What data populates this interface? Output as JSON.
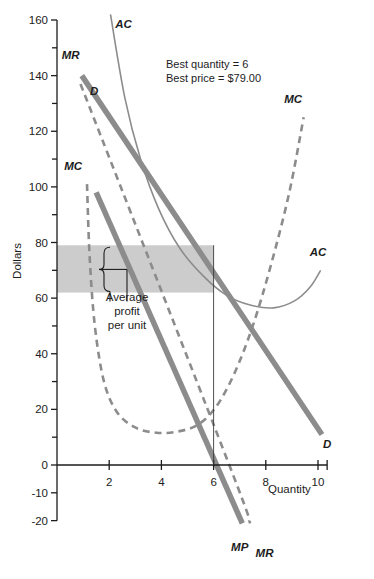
{
  "chart_data": {
    "type": "line",
    "title": "",
    "xlabel": "Quantity",
    "ylabel": "Dollars",
    "xlim": [
      0,
      10.6
    ],
    "ylim": [
      -20,
      160
    ],
    "x_ticks": [
      2,
      4,
      6,
      8,
      10
    ],
    "x_tick_labels": [
      "2",
      "4",
      "6",
      "8",
      "10"
    ],
    "y_ticks": [
      -20,
      -10,
      0,
      20,
      40,
      60,
      80,
      100,
      120,
      140,
      160
    ],
    "y_tick_labels": [
      "-20",
      "-10",
      "0",
      "20",
      "40",
      "60",
      "80",
      "100",
      "120",
      "140",
      "160"
    ],
    "y_minor_ticks": [
      10,
      30,
      50,
      70,
      90,
      110,
      130,
      150
    ],
    "grid": false,
    "legend_position": "inline-labels",
    "series": [
      {
        "name": "D",
        "label": "D",
        "style": "dashed",
        "color": "#8c8c8c",
        "width": 2.6,
        "points": [
          [
            0.9,
            137
          ],
          [
            6.6,
            0
          ],
          [
            7.4,
            -21
          ]
        ]
      },
      {
        "name": "MR",
        "label": "MR",
        "style": "solid-thick",
        "color": "#8c8c8c",
        "width": 5.5,
        "points": [
          [
            0.95,
            140
          ],
          [
            10.15,
            11
          ]
        ]
      },
      {
        "name": "MP",
        "label": "MP",
        "style": "solid-thick",
        "color": "#8c8c8c",
        "width": 5.5,
        "points": [
          [
            1.5,
            98
          ],
          [
            7.1,
            -21
          ]
        ]
      },
      {
        "name": "MC",
        "label": "MC",
        "style": "dashed",
        "color": "#8c8c8c",
        "width": 2.6,
        "points": [
          [
            1.15,
            101
          ],
          [
            1.25,
            75
          ],
          [
            1.45,
            50
          ],
          [
            1.8,
            30
          ],
          [
            2.3,
            19
          ],
          [
            3.0,
            13.5
          ],
          [
            3.8,
            11.6
          ],
          [
            4.6,
            12.0
          ],
          [
            5.4,
            14.5
          ],
          [
            6.1,
            21
          ],
          [
            6.8,
            33
          ],
          [
            7.5,
            50
          ],
          [
            8.2,
            72
          ],
          [
            8.9,
            98
          ],
          [
            9.45,
            125
          ]
        ]
      },
      {
        "name": "AC",
        "label": "AC",
        "style": "solid-thin",
        "color": "#8c8c8c",
        "width": 1.6,
        "points": [
          [
            2.05,
            162
          ],
          [
            2.6,
            132
          ],
          [
            3.2,
            110
          ],
          [
            3.9,
            92
          ],
          [
            4.7,
            78
          ],
          [
            5.6,
            68
          ],
          [
            6.5,
            61
          ],
          [
            7.4,
            57.5
          ],
          [
            8.3,
            56.5
          ],
          [
            9.1,
            59
          ],
          [
            9.7,
            64
          ],
          [
            10.1,
            70
          ]
        ]
      }
    ],
    "annotations": {
      "info_line1": "Best quantity = 6",
      "info_line2": "Best price = $79.00",
      "bracket_label_line1": "Average",
      "bracket_label_line2": "profit",
      "bracket_label_line3": "per unit"
    },
    "shaded_region": {
      "x_start": 0,
      "x_end": 6.0,
      "y_bottom": 62,
      "y_top": 79,
      "color": "#cccccc"
    },
    "best_quantity": 6,
    "best_price": 79.0,
    "curve_label_positions": [
      {
        "label": "AC",
        "x": 2.55,
        "y": 157
      },
      {
        "label": "MR",
        "x": 0.52,
        "y": 146
      },
      {
        "label": "D",
        "x": 1.42,
        "y": 133
      },
      {
        "label": "MC",
        "x": 0.62,
        "y": 106
      },
      {
        "label": "MC",
        "x": 9.05,
        "y": 130
      },
      {
        "label": "AC",
        "x": 10.0,
        "y": 75
      },
      {
        "label": "D",
        "x": 10.35,
        "y": 6
      },
      {
        "label": "MP",
        "x": 7.0,
        "y": -31
      },
      {
        "label": "MR",
        "x": 7.95,
        "y": -33
      }
    ]
  }
}
